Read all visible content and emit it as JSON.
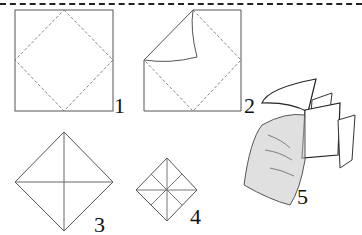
{
  "diagram": {
    "steps": [
      {
        "number": "1",
        "description": "Square paper with diagonal fold lines"
      },
      {
        "number": "2",
        "description": "Fold corners to center"
      },
      {
        "number": "3",
        "description": "Folded square with corners meeting at center"
      },
      {
        "number": "4",
        "description": "Smaller folded square after second fold"
      },
      {
        "number": "5",
        "description": "Hand operating the finished fortune teller"
      }
    ],
    "colors": {
      "line": "#555555",
      "dash": "#777777",
      "ink": "#111111",
      "shade": "#bbbbbb"
    }
  }
}
